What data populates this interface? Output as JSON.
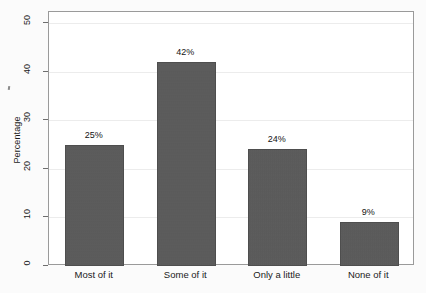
{
  "chart_data": {
    "type": "bar",
    "title": "",
    "subtitle": "",
    "xlabel": "",
    "ylabel": "Percentage",
    "categories": [
      "Most of it",
      "Some of it",
      "Only a little",
      "None of it"
    ],
    "values": [
      25,
      42,
      24,
      9
    ],
    "value_labels": [
      "25%",
      "42%",
      "24%",
      "9%"
    ],
    "ylim": [
      0,
      50
    ],
    "yticks": [
      0,
      10,
      20,
      30,
      40,
      50
    ],
    "ytick_labels": [
      "0",
      "10",
      "20",
      "30",
      "40",
      "50"
    ],
    "grid": true,
    "grid_axis": "y",
    "legend": false,
    "legend_position": "none",
    "orientation": "vertical",
    "bar_color": "#595959",
    "frame_color": "#9a9a9a",
    "gridline_color": "#ececec",
    "background_color": "#fbfbfb",
    "text_color": "#1a1a1a",
    "ytick_label_rotation": -90,
    "ylabel_rotation": -90
  }
}
